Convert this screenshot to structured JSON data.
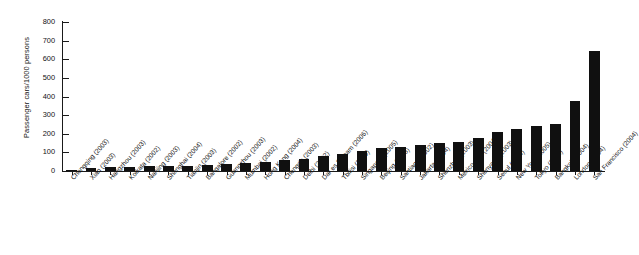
{
  "chart_data": {
    "type": "bar",
    "title": "",
    "xlabel": "",
    "ylabel": "Passenger cars/1000 persons",
    "ylim": [
      0,
      800
    ],
    "yticks": [
      0,
      100,
      200,
      300,
      400,
      500,
      600,
      700,
      800
    ],
    "grid": false,
    "legend": "none",
    "bar_color": "#101010",
    "axis_color": "#1a1a1a",
    "background": "#ffffff",
    "categories": [
      "Chongqing (2003)",
      "Xian (2003)",
      "Hangzhou (2003)",
      "Kolkata (2002)",
      "Nanjing (2003)",
      "Shanghai (2004)",
      "Tianjin (2003)",
      "Bangalore (2002)",
      "Guangzhou (2003)",
      "Mumbai (2002)",
      "Hong Kong (2004)",
      "Chengdu (2003)",
      "Delhi (2002)",
      "Dar es Salaam (2006)",
      "Tbilisi (2000)",
      "Singapore (2005)",
      "Beijing (2005)",
      "Santiago (2002)",
      "Jakarta (2004)",
      "Shenzhen (2003)",
      "Mexico City (2004)",
      "Shenyang (2003)",
      "Seoul (2004)",
      "New York (2005)",
      "Tokyo (2005)",
      "Bangkok (2004)",
      "London (2004)",
      "San Francisco (2004)"
    ],
    "values": [
      8,
      14,
      22,
      22,
      25,
      27,
      29,
      33,
      38,
      44,
      50,
      57,
      64,
      78,
      90,
      106,
      122,
      128,
      140,
      150,
      154,
      176,
      208,
      228,
      242,
      254,
      378,
      644
    ]
  },
  "axis": {
    "y_label": "Passenger cars/1000 persons",
    "tick_labels": [
      "800",
      "700",
      "600",
      "500",
      "400",
      "300",
      "200",
      "100",
      "0"
    ]
  }
}
